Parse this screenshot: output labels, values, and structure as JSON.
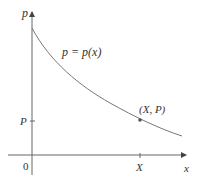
{
  "diagram": {
    "type": "function-graph",
    "y_axis_label": "p",
    "x_axis_label": "x",
    "curve_label": "p = p(x)",
    "origin_label": "0",
    "y_tick_label": "P",
    "x_tick_label": "X",
    "point_label": "(X, P)",
    "curve_description": "decreasing, concave-up demand curve",
    "colors": {
      "axis": "#555555",
      "curve": "#666666",
      "text": "#333333"
    }
  }
}
